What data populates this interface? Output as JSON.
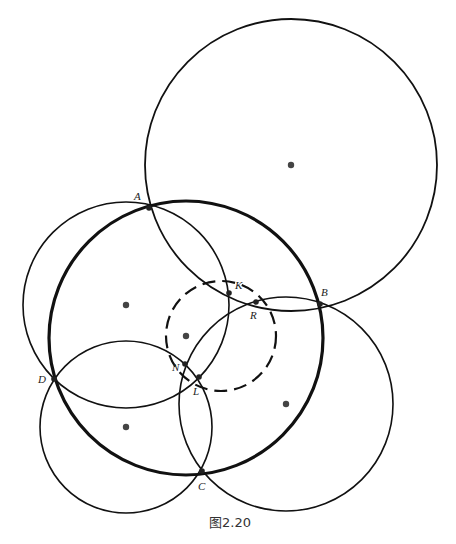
{
  "figure": {
    "caption": "图2.20",
    "caption_pos": {
      "x": 230,
      "y": 527
    },
    "circles": [
      {
        "id": "top-right",
        "cx": 291,
        "cy": 165,
        "r": 146,
        "stroke_width": 1.8,
        "dashed": false
      },
      {
        "id": "main-thick",
        "cx": 186,
        "cy": 338,
        "r": 137,
        "stroke_width": 3.2,
        "dashed": false
      },
      {
        "id": "upper-left",
        "cx": 126,
        "cy": 305,
        "r": 103,
        "stroke_width": 1.6,
        "dashed": false
      },
      {
        "id": "lower-left",
        "cx": 126,
        "cy": 427,
        "r": 86,
        "stroke_width": 1.6,
        "dashed": false
      },
      {
        "id": "lower-right",
        "cx": 286,
        "cy": 404,
        "r": 107,
        "stroke_width": 1.6,
        "dashed": false
      },
      {
        "id": "dashed",
        "cx": 221,
        "cy": 336,
        "r": 55,
        "stroke_width": 2.2,
        "dashed": true
      }
    ],
    "centers": [
      {
        "x": 291,
        "y": 165
      },
      {
        "x": 126,
        "y": 305
      },
      {
        "x": 186,
        "y": 336
      },
      {
        "x": 126,
        "y": 427
      },
      {
        "x": 286,
        "y": 404
      }
    ],
    "points": [
      {
        "name": "A",
        "x": 149,
        "y": 208,
        "lx": 134,
        "ly": 200
      },
      {
        "name": "K",
        "x": 229,
        "y": 293,
        "lx": 235,
        "ly": 289
      },
      {
        "name": "R",
        "x": 256,
        "y": 302,
        "lx": 250,
        "ly": 319
      },
      {
        "name": "B",
        "x": 320,
        "y": 304,
        "lx": 321,
        "ly": 296
      },
      {
        "name": "D",
        "x": 54,
        "y": 379,
        "lx": 38,
        "ly": 383
      },
      {
        "name": "N",
        "x": 185,
        "y": 364,
        "lx": 172,
        "ly": 371
      },
      {
        "name": "L",
        "x": 199,
        "y": 377,
        "lx": 193,
        "ly": 395
      },
      {
        "name": "C",
        "x": 202,
        "y": 471,
        "lx": 198,
        "ly": 490
      }
    ],
    "colors": {
      "stroke": "#111111",
      "dot": "#444444",
      "point": "#222222"
    }
  }
}
